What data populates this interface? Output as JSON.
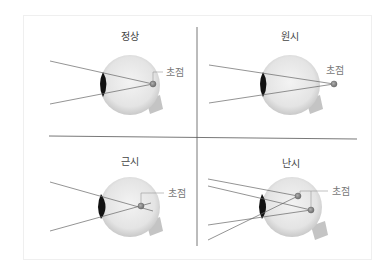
{
  "diagram": {
    "panels": [
      {
        "id": "normal",
        "title": "정상",
        "focus_label": "초점"
      },
      {
        "id": "hyperopia",
        "title": "원시",
        "focus_label": "초점"
      },
      {
        "id": "myopia",
        "title": "근시",
        "focus_label": "초점"
      },
      {
        "id": "astigmatism",
        "title": "난시",
        "focus_label": "초점"
      }
    ],
    "colors": {
      "eyeball": "#e6e6e6",
      "eyeball_edge": "#c8c8c8",
      "lens": "#111111",
      "ray": "#666666",
      "focus": "#8a8a8a",
      "divider": "#555555",
      "nerve": "#bdbdbd"
    }
  }
}
